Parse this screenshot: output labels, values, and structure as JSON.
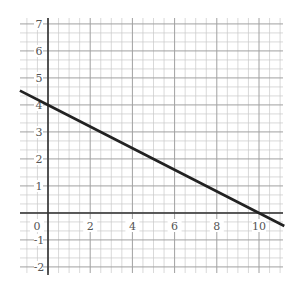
{
  "chart_data": {
    "type": "line",
    "title": "",
    "xlabel": "",
    "ylabel": "",
    "xlim": [
      -1.33,
      11.2
    ],
    "ylim": [
      -2.2,
      7.2
    ],
    "grid": true,
    "minor_grid_step": 0.5,
    "major_grid_step": 1,
    "x_ticks": [
      0,
      2,
      4,
      6,
      8,
      10
    ],
    "x_tick_labels": [
      "0",
      "2",
      "4",
      "6",
      "8",
      "10"
    ],
    "y_ticks": [
      7,
      6,
      5,
      4,
      3,
      2,
      1,
      -1,
      -2
    ],
    "y_tick_labels": [
      "7",
      "6",
      "5",
      "4",
      "3",
      "2",
      "1",
      "-1",
      "-2"
    ],
    "series": [
      {
        "name": "line",
        "equation": "y = 4 - 0.4x",
        "x": [
          -1.33,
          0,
          10,
          11.2
        ],
        "y": [
          4.53,
          4,
          0,
          -0.48
        ],
        "color": "#222222"
      }
    ]
  },
  "colors": {
    "grid_minor": "#c8c8c8",
    "grid_major": "#a0a0a0",
    "axis": "#333333",
    "line": "#222222"
  }
}
